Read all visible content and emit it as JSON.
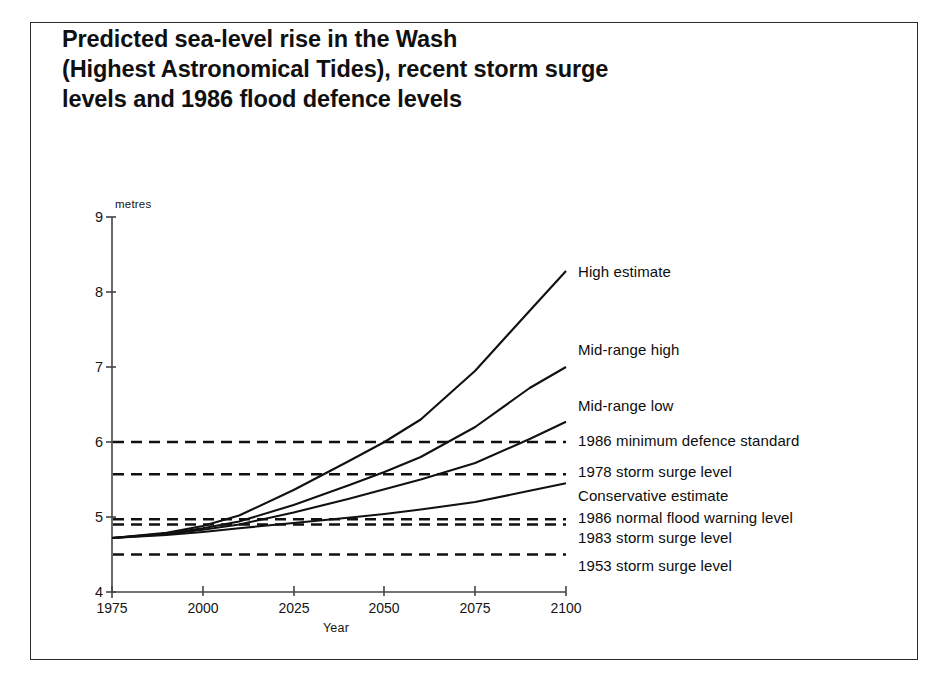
{
  "figure": {
    "title": "Predicted sea-level rise in the Wash\n(Highest Astronomical Tides), recent storm surge\nlevels and 1986 flood defence levels"
  },
  "chart_data": {
    "type": "line",
    "title": "Predicted sea-level rise in the Wash (Highest Astronomical Tides), recent storm surge levels and 1986 flood defence levels",
    "xlabel": "Year",
    "ylabel": "metres",
    "yunit_label": "metres",
    "xlim": [
      1975,
      2100
    ],
    "ylim": [
      4,
      9
    ],
    "xticks": [
      1975,
      2000,
      2025,
      2050,
      2075,
      2100
    ],
    "yticks": [
      4,
      5,
      6,
      7,
      8,
      9
    ],
    "grid": false,
    "legend": "right-inline-annotations",
    "line_color": "#111111",
    "series": [
      {
        "name": "High estimate",
        "label": "High estimate",
        "x": [
          1975,
          1990,
          2000,
          2010,
          2025,
          2040,
          2050,
          2060,
          2075,
          2090,
          2100
        ],
        "values": [
          4.72,
          4.79,
          4.88,
          5.02,
          5.36,
          5.74,
          6.0,
          6.3,
          6.95,
          7.75,
          8.28
        ]
      },
      {
        "name": "Mid-range high",
        "label": "Mid-range high",
        "x": [
          1975,
          1990,
          2000,
          2010,
          2025,
          2040,
          2050,
          2060,
          2075,
          2090,
          2100
        ],
        "values": [
          4.72,
          4.78,
          4.85,
          4.94,
          5.16,
          5.42,
          5.6,
          5.8,
          6.2,
          6.72,
          7.0
        ]
      },
      {
        "name": "Mid-range low",
        "label": "Mid-range low",
        "x": [
          1975,
          1990,
          2000,
          2010,
          2025,
          2040,
          2050,
          2060,
          2075,
          2090,
          2100
        ],
        "values": [
          4.72,
          4.77,
          4.83,
          4.9,
          5.06,
          5.24,
          5.37,
          5.5,
          5.72,
          6.04,
          6.27
        ]
      },
      {
        "name": "Conservative estimate",
        "label": "Conservative estimate",
        "x": [
          1975,
          1990,
          2000,
          2010,
          2025,
          2040,
          2050,
          2060,
          2075,
          2090,
          2100
        ],
        "values": [
          4.72,
          4.76,
          4.8,
          4.85,
          4.92,
          4.99,
          5.04,
          5.1,
          5.2,
          5.35,
          5.45
        ]
      }
    ],
    "reference_lines": [
      {
        "name": "1986 minimum defence standard",
        "label": "1986 minimum defence standard",
        "value": 6.0,
        "style": "dashed"
      },
      {
        "name": "1978 storm surge level",
        "label": "1978 storm surge level",
        "value": 5.57,
        "style": "dashed"
      },
      {
        "name": "1986 normal flood warning level",
        "label": "1986 normal flood warning level",
        "value": 4.97,
        "style": "dashed"
      },
      {
        "name": "1983 storm surge level",
        "label": "1983 storm surge level",
        "value": 4.9,
        "style": "dashed"
      },
      {
        "name": "1953 storm surge level",
        "label": "1953 storm surge level",
        "value": 4.5,
        "style": "dashed"
      }
    ],
    "annotations": [
      {
        "name": "Conservative estimate",
        "label": "Conservative estimate",
        "value": 5.45
      }
    ]
  },
  "axis": {
    "y_unit": "metres",
    "y_ticks": [
      "9",
      "8",
      "7",
      "6",
      "5",
      "4"
    ],
    "x_ticks": [
      "1975",
      "2000",
      "2025",
      "2050",
      "2075",
      "2100"
    ],
    "x_title": "Year"
  },
  "labels": {
    "high_estimate": "High estimate",
    "mid_range_high": "Mid-range high",
    "mid_range_low": "Mid-range low",
    "defence_standard_1986": "1986 minimum defence standard",
    "surge_1978": "1978 storm surge level",
    "conservative_estimate": "Conservative estimate",
    "warning_1986": "1986 normal flood warning level",
    "surge_1983": "1983 storm surge level",
    "surge_1953": "1953 storm surge level"
  }
}
